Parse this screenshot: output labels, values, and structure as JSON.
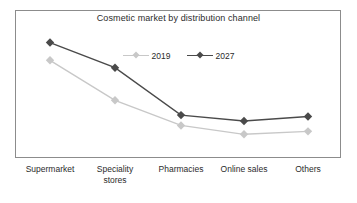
{
  "chart_data": {
    "type": "line",
    "title": "Cosmetic market by distribution channel",
    "xlabel": "",
    "ylabel": "",
    "grid": false,
    "legend_position": "top-center",
    "ylim": [
      0,
      100
    ],
    "categories": [
      "Supermarket",
      "Speciality\nstores",
      "Pharmacies",
      "Online sales",
      "Others"
    ],
    "series": [
      {
        "name": "2019",
        "color": "#c8c8c8",
        "marker": "diamond",
        "values": [
          66,
          39,
          22,
          16,
          18
        ]
      },
      {
        "name": "2027",
        "color": "#4a4a4a",
        "marker": "diamond",
        "values": [
          78,
          61,
          29,
          25,
          28
        ]
      }
    ]
  },
  "chart": {
    "title": "Cosmetic market by distribution channel",
    "frame_color": "#8c8c8c",
    "background": "#ffffff"
  },
  "legend": {
    "entries": [
      {
        "label": "2019",
        "color": "#c8c8c8"
      },
      {
        "label": "2027",
        "color": "#4a4a4a"
      }
    ]
  },
  "axis": {
    "categories": [
      {
        "label": "Supermarket"
      },
      {
        "label": "Speciality\nstores"
      },
      {
        "label": "Pharmacies"
      },
      {
        "label": "Online sales"
      },
      {
        "label": "Others"
      }
    ]
  }
}
